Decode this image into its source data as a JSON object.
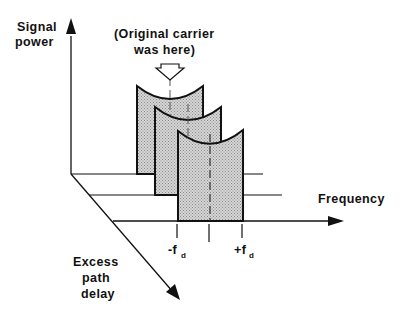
{
  "diagram": {
    "type": "3d-doppler-spectrum",
    "axes": {
      "vertical": {
        "label_lines": [
          "Signal",
          "power"
        ]
      },
      "horizontal": {
        "label": "Frequency"
      },
      "depth": {
        "label_lines": [
          "Excess",
          "path",
          "delay"
        ]
      }
    },
    "annotation": {
      "lines": [
        "(Original carrier",
        "was here)"
      ],
      "pointer": "hollow-down-arrow"
    },
    "ticks": {
      "left": {
        "main": "-f",
        "sub": "d"
      },
      "right": {
        "main": "+f",
        "sub": "d"
      }
    },
    "panels": [
      {
        "name": "delay-slice-1",
        "position": "back"
      },
      {
        "name": "delay-slice-2",
        "position": "middle"
      },
      {
        "name": "delay-slice-3",
        "position": "front"
      }
    ],
    "colors": {
      "stroke": "#111111",
      "fill_stipple": "#c8c8c8"
    }
  }
}
